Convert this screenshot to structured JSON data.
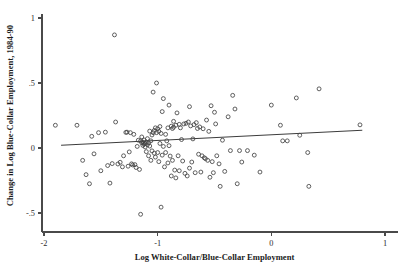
{
  "chart_data": {
    "type": "scatter",
    "title": "",
    "subtitle": "",
    "xlabel": "Log White-Collar/Blue-Collar Employment",
    "ylabel": "Change in Log Blue-Collar Employment, 1984-90",
    "xlim": [
      -2,
      1
    ],
    "ylim": [
      -0.58,
      1.0
    ],
    "xticks": [
      -2,
      -1,
      0,
      1
    ],
    "xticklabels": [
      "-2",
      "-1",
      "0",
      "1"
    ],
    "yticks": [
      1,
      0.5,
      0,
      -0.5
    ],
    "yticklabels": [
      "1",
      ".5",
      "0",
      "-.5"
    ],
    "grid": false,
    "legend": null,
    "marker_style": "open-circle",
    "marker_color": "#434343",
    "fit_line": {
      "label": "linear fit",
      "color": "#3c3c3c",
      "x0": -1.85,
      "y0": 0.021,
      "x1": 0.8,
      "y1": 0.137,
      "slope": 0.0438,
      "intercept": 0.1021
    },
    "n_points": 152,
    "points": [
      [
        -1.9,
        0.175
      ],
      [
        -1.71,
        0.175
      ],
      [
        -1.66,
        -0.095
      ],
      [
        -1.63,
        -0.205
      ],
      [
        -1.6,
        -0.275
      ],
      [
        -1.58,
        0.09
      ],
      [
        -1.56,
        -0.045
      ],
      [
        -1.52,
        0.118
      ],
      [
        -1.5,
        -0.175
      ],
      [
        -1.46,
        0.122
      ],
      [
        -1.44,
        -0.135
      ],
      [
        -1.42,
        -0.27
      ],
      [
        -1.4,
        -0.12
      ],
      [
        -1.38,
        0.87
      ],
      [
        -1.37,
        0.2
      ],
      [
        -1.35,
        -0.123
      ],
      [
        -1.33,
        -0.11
      ],
      [
        -1.31,
        -0.145
      ],
      [
        -1.3,
        -0.06
      ],
      [
        -1.28,
        0.12
      ],
      [
        -1.27,
        0.122
      ],
      [
        -1.26,
        -0.14
      ],
      [
        -1.25,
        -0.03
      ],
      [
        -1.24,
        0.118
      ],
      [
        -1.23,
        -0.122
      ],
      [
        -1.22,
        -0.13
      ],
      [
        -1.21,
        0.105
      ],
      [
        -1.2,
        -0.128
      ],
      [
        -1.19,
        -0.15
      ],
      [
        -1.18,
        0.012
      ],
      [
        -1.17,
        0.06
      ],
      [
        -1.16,
        -0.165
      ],
      [
        -1.15,
        -0.51
      ],
      [
        -1.15,
        0.055
      ],
      [
        -1.14,
        0.04
      ],
      [
        -1.14,
        0.085
      ],
      [
        -1.13,
        0.045
      ],
      [
        -1.13,
        0.02
      ],
      [
        -1.12,
        0.03
      ],
      [
        -1.12,
        0.062
      ],
      [
        -1.11,
        0.035
      ],
      [
        -1.11,
        0.008
      ],
      [
        -1.1,
        0.045
      ],
      [
        -1.1,
        -0.028
      ],
      [
        -1.09,
        0.025
      ],
      [
        -1.09,
        0.072
      ],
      [
        -1.08,
        0.04
      ],
      [
        -1.08,
        -0.06
      ],
      [
        -1.07,
        0.015
      ],
      [
        -1.07,
        0.13
      ],
      [
        -1.06,
        0.055
      ],
      [
        -1.06,
        -0.095
      ],
      [
        -1.05,
        0.1
      ],
      [
        -1.05,
        -0.022
      ],
      [
        -1.04,
        0.43
      ],
      [
        -1.04,
        0.118
      ],
      [
        -1.03,
        -0.04
      ],
      [
        -1.03,
        0.135
      ],
      [
        -1.02,
        0.155
      ],
      [
        -1.02,
        -0.07
      ],
      [
        -1.01,
        0.5
      ],
      [
        -1.01,
        0.118
      ],
      [
        -1.0,
        0.148
      ],
      [
        -1.0,
        -0.035
      ],
      [
        -0.99,
        0.128
      ],
      [
        -0.99,
        -0.105
      ],
      [
        -0.98,
        0.165
      ],
      [
        -0.98,
        0.035
      ],
      [
        -0.97,
        -0.455
      ],
      [
        -0.97,
        0.112
      ],
      [
        -0.96,
        0.28
      ],
      [
        -0.96,
        -0.055
      ],
      [
        -0.95,
        0.012
      ],
      [
        -0.95,
        0.38
      ],
      [
        -0.94,
        -0.145
      ],
      [
        -0.93,
        0.105
      ],
      [
        -0.93,
        -0.035
      ],
      [
        -0.92,
        0.055
      ],
      [
        -0.91,
        0.155
      ],
      [
        -0.91,
        -0.115
      ],
      [
        -0.9,
        0.33
      ],
      [
        -0.9,
        0.018
      ],
      [
        -0.89,
        -0.062
      ],
      [
        -0.88,
        0.168
      ],
      [
        -0.88,
        -0.215
      ],
      [
        -0.87,
        0.15
      ],
      [
        -0.87,
        -0.095
      ],
      [
        -0.86,
        0.205
      ],
      [
        -0.86,
        0.16
      ],
      [
        -0.85,
        -0.17
      ],
      [
        -0.84,
        0.175
      ],
      [
        -0.84,
        -0.23
      ],
      [
        -0.83,
        0.27
      ],
      [
        -0.82,
        -0.06
      ],
      [
        -0.81,
        0.182
      ],
      [
        -0.81,
        -0.175
      ],
      [
        -0.8,
        0.155
      ],
      [
        -0.79,
        0.065
      ],
      [
        -0.78,
        -0.1
      ],
      [
        -0.77,
        0.185
      ],
      [
        -0.76,
        -0.195
      ],
      [
        -0.75,
        0.19
      ],
      [
        -0.74,
        -0.215
      ],
      [
        -0.73,
        0.2
      ],
      [
        -0.72,
        0.318
      ],
      [
        -0.72,
        -0.155
      ],
      [
        -0.71,
        0.17
      ],
      [
        -0.7,
        -0.108
      ],
      [
        -0.69,
        0.07
      ],
      [
        -0.68,
        0.18
      ],
      [
        -0.67,
        -0.19
      ],
      [
        -0.66,
        0.195
      ],
      [
        -0.65,
        0.15
      ],
      [
        -0.64,
        -0.048
      ],
      [
        -0.63,
        0.162
      ],
      [
        -0.62,
        -0.185
      ],
      [
        -0.61,
        -0.06
      ],
      [
        -0.6,
        0.148
      ],
      [
        -0.59,
        -0.075
      ],
      [
        -0.58,
        -0.082
      ],
      [
        -0.57,
        0.215
      ],
      [
        -0.56,
        -0.095
      ],
      [
        -0.55,
        0.128
      ],
      [
        -0.54,
        -0.225
      ],
      [
        -0.53,
        0.325
      ],
      [
        -0.52,
        -0.105
      ],
      [
        -0.51,
        -0.19
      ],
      [
        -0.5,
        0.275
      ],
      [
        -0.49,
        0.185
      ],
      [
        -0.48,
        -0.06
      ],
      [
        -0.46,
        -0.122
      ],
      [
        -0.45,
        -0.295
      ],
      [
        -0.43,
        0.06
      ],
      [
        -0.41,
        -0.18
      ],
      [
        -0.38,
        0.24
      ],
      [
        -0.36,
        -0.02
      ],
      [
        -0.34,
        0.405
      ],
      [
        -0.32,
        0.3
      ],
      [
        -0.3,
        -0.275
      ],
      [
        -0.28,
        -0.02
      ],
      [
        -0.26,
        -0.108
      ],
      [
        -0.21,
        -0.02
      ],
      [
        -0.15,
        -0.055
      ],
      [
        -0.1,
        -0.185
      ],
      [
        0.0,
        0.33
      ],
      [
        0.08,
        0.175
      ],
      [
        0.1,
        0.055
      ],
      [
        0.14,
        0.055
      ],
      [
        0.22,
        0.385
      ],
      [
        0.25,
        0.098
      ],
      [
        0.32,
        -0.035
      ],
      [
        0.33,
        -0.295
      ],
      [
        0.42,
        0.455
      ],
      [
        0.78,
        0.178
      ]
    ]
  }
}
